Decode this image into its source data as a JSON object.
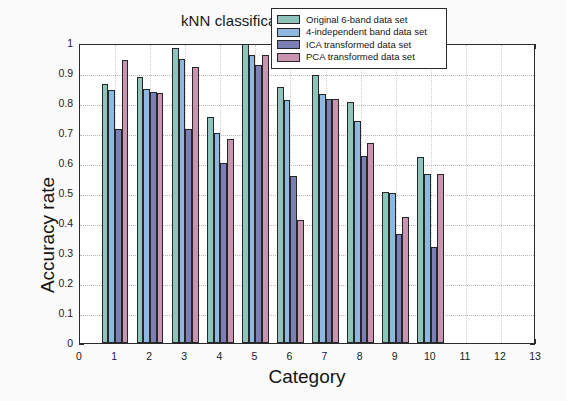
{
  "figure": {
    "title": "kNN classification results comparison",
    "background": "#fbfbfb",
    "plot_background": "#ffffff",
    "axis_color": "#2b2b2b"
  },
  "legend": {
    "position": "top-right-inside",
    "entries": [
      {
        "label": "Original 6-band data set",
        "color": "#8fc4bc"
      },
      {
        "label": "4-independent band data set",
        "color": "#8fb8e0"
      },
      {
        "label": "ICA transformed data set",
        "color": "#7b7fb5"
      },
      {
        "label": "PCA transformed data set",
        "color": "#c795b0"
      }
    ]
  },
  "axes": {
    "x": {
      "label": "Category",
      "ticks": [
        "0",
        "1",
        "2",
        "3",
        "4",
        "5",
        "6",
        "7",
        "8",
        "9",
        "10",
        "11",
        "12",
        "13"
      ],
      "min": 0,
      "max": 13
    },
    "y": {
      "label": "Accuracy rate",
      "ticks": [
        "0",
        "0.1",
        "0.2",
        "0.3",
        "0.4",
        "0.5",
        "0.6",
        "0.7",
        "0.8",
        "0.9",
        "1"
      ],
      "min": 0,
      "max": 1
    }
  },
  "chart_data": {
    "type": "bar",
    "title": "kNN classification results comparison",
    "xlabel": "Category",
    "ylabel": "Accuracy rate",
    "xlim": [
      0,
      13
    ],
    "ylim": [
      0,
      1
    ],
    "grid": true,
    "legend_position": "upper right",
    "categories": [
      "1",
      "2",
      "3",
      "4",
      "5",
      "6",
      "7",
      "8",
      "9",
      "10"
    ],
    "series": [
      {
        "name": "Original 6-band data set",
        "color": "#8fc4bc",
        "values": [
          0.862,
          0.888,
          0.985,
          0.752,
          1.0,
          0.855,
          0.895,
          0.805,
          0.502,
          0.62
        ]
      },
      {
        "name": "4-independent band data set",
        "color": "#8fb8e0",
        "values": [
          0.845,
          0.848,
          0.947,
          0.7,
          0.96,
          0.81,
          0.83,
          0.74,
          0.5,
          0.565
        ]
      },
      {
        "name": "ICA transformed data set",
        "color": "#7b7fb5",
        "values": [
          0.712,
          0.837,
          0.715,
          0.6,
          0.928,
          0.557,
          0.815,
          0.625,
          0.365,
          0.32
        ]
      },
      {
        "name": "PCA transformed data set",
        "color": "#c795b0",
        "values": [
          0.944,
          0.832,
          0.92,
          0.68,
          0.96,
          0.41,
          0.815,
          0.667,
          0.42,
          0.565
        ]
      }
    ]
  }
}
